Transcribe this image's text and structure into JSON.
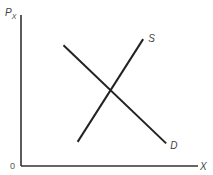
{
  "chart_data": {
    "type": "line",
    "title": "",
    "xlabel": "X",
    "ylabel": "P",
    "ylabel_subscript": "X",
    "origin_label": "0",
    "xlim": [
      0,
      10
    ],
    "ylim": [
      0,
      10
    ],
    "grid": false,
    "legend": "none",
    "series": [
      {
        "name": "D",
        "label": "D",
        "x": [
          2.4,
          8.2
        ],
        "y": [
          8.0,
          1.5
        ]
      },
      {
        "name": "S",
        "label": "S",
        "x": [
          3.2,
          6.9
        ],
        "y": [
          1.6,
          8.4
        ]
      }
    ]
  }
}
